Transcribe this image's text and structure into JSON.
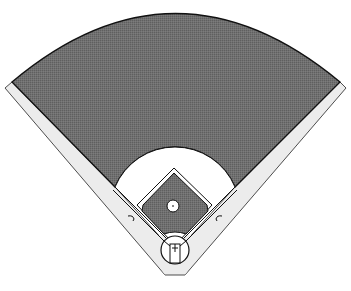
{
  "diagram": {
    "title": "Baseball field diagram",
    "colors": {
      "background": "#ffffff",
      "grass": "#6e6e6e",
      "warning_track": "#ececec",
      "infield_dirt": "#ffffff",
      "lines": "#111111"
    },
    "elements": [
      {
        "name": "outfield-grass",
        "label": "Outfield grass"
      },
      {
        "name": "warning-track-left",
        "label": "Left foul territory"
      },
      {
        "name": "warning-track-right",
        "label": "Right foul territory"
      },
      {
        "name": "infield-dirt",
        "label": "Infield dirt"
      },
      {
        "name": "infield-grass",
        "label": "Infield grass"
      },
      {
        "name": "pitchers-mound",
        "label": "Pitcher's mound"
      },
      {
        "name": "home-plate-circle",
        "label": "Home plate area"
      },
      {
        "name": "batters-box",
        "label": "Batter's box"
      },
      {
        "name": "coach-box-left",
        "label": "Third base coach's box"
      },
      {
        "name": "coach-box-right",
        "label": "First base coach's box"
      }
    ]
  }
}
